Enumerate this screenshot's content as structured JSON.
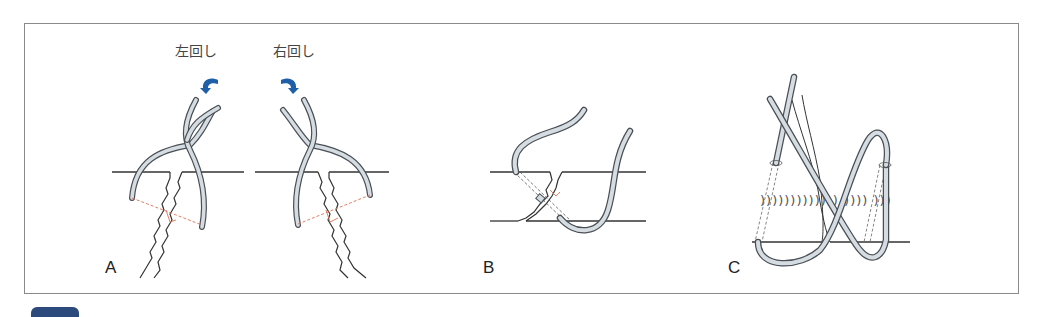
{
  "figure": {
    "panels": [
      {
        "id": "A",
        "label": "A"
      },
      {
        "id": "B",
        "label": "B"
      },
      {
        "id": "C",
        "label": "C"
      }
    ],
    "rotation_labels": {
      "left": "左回し",
      "right": "右回し"
    },
    "icons": {
      "left_arrow": "counterclockwise-rotation-arrow",
      "right_arrow": "clockwise-rotation-arrow"
    },
    "colors": {
      "wire_fill": "#d5dde3",
      "wire_stroke": "#4a4f55",
      "arrow_blue": "#1f5fa8",
      "guide_dash": "#e07050",
      "frame": "#8a8a8a",
      "line": "#333333"
    }
  }
}
